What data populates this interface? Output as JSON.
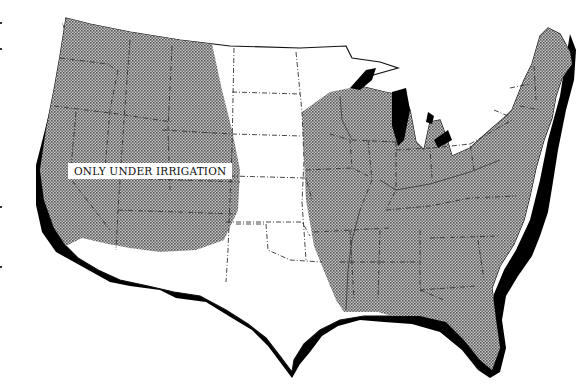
{
  "map": {
    "subject": "Contiguous United States",
    "legend_colors": {
      "shaded": "#9c9c9c",
      "unshaded": "#ffffff",
      "coast_shadow": "#000000",
      "boundaries": "#333333"
    },
    "regions": [
      {
        "name": "western-region",
        "style": "shaded"
      },
      {
        "name": "great-plains-region",
        "style": "unshaded"
      },
      {
        "name": "eastern-region",
        "style": "shaded"
      }
    ],
    "annotations": [
      {
        "text": "ONLY UNDER IRRIGATION",
        "region": "western-region"
      }
    ]
  }
}
